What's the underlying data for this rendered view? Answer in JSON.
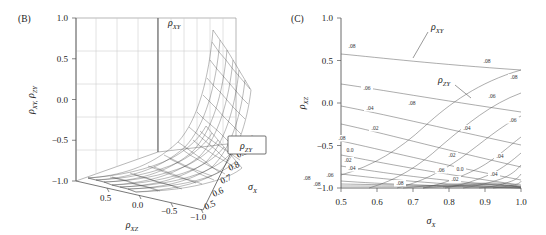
{
  "figure": {
    "panels": [
      "B",
      "C"
    ],
    "background": "#ffffff",
    "line_color": "#3a3a3a"
  },
  "panelB": {
    "tag": "(B)",
    "type": "surface3d",
    "y_axis": {
      "label_rho1": "ρ",
      "label_sub1": "XY,",
      "label_rho2": "ρ",
      "label_sub2": "ZY",
      "ticks": [
        "1.0",
        "0.5",
        "0.0",
        "−0.5",
        "−1.0"
      ],
      "values": [
        1.0,
        0.5,
        0.0,
        -0.5,
        -1.0
      ],
      "range": [
        -1.0,
        1.0
      ]
    },
    "x_axis": {
      "label_rho": "ρ",
      "label_sub": "XZ",
      "ticks": [
        "0.5",
        "0.0",
        "−0.5",
        "−1.0"
      ],
      "values": [
        0.5,
        0.0,
        -0.5,
        -1.0
      ],
      "range": [
        1.0,
        -1.0
      ]
    },
    "z_axis": {
      "label_sigma": "σ",
      "label_sub": "X",
      "ticks": [
        "0.5",
        "0.6",
        "0.7",
        "0.8",
        "0.9",
        "1.0"
      ],
      "values": [
        0.5,
        0.6,
        0.7,
        0.8,
        0.9,
        1.0
      ],
      "range": [
        0.5,
        1.0
      ]
    },
    "surface_labels": [
      {
        "name": "surface-label-rho-xy",
        "rho": "ρ",
        "sub": "XY",
        "boxed": false
      },
      {
        "name": "surface-label-rho-zy",
        "rho": "ρ",
        "sub": "ZY",
        "boxed": true
      }
    ]
  },
  "panelC": {
    "tag": "(C)",
    "type": "contour",
    "y_axis": {
      "label_rho": "ρ",
      "label_sub": "XZ",
      "ticks": [
        "1.0",
        "0.5",
        "0.0",
        "−0.5",
        "−1.0"
      ],
      "values": [
        1.0,
        0.5,
        0.0,
        -0.5,
        -1.0
      ],
      "range": [
        -1.0,
        1.0
      ]
    },
    "x_axis": {
      "label_sigma": "σ",
      "label_sub": "X",
      "ticks": [
        "0.5",
        "0.6",
        "0.7",
        "0.8",
        "0.9",
        "1.0"
      ],
      "values": [
        0.5,
        0.6,
        0.7,
        0.8,
        0.9,
        1.0
      ],
      "range": [
        0.5,
        1.0
      ]
    },
    "series_labels": [
      {
        "name": "contour-family-rho-xy",
        "rho": "ρ",
        "sub": "XY"
      },
      {
        "name": "contour-family-rho-zy",
        "rho": "ρ",
        "sub": "ZY"
      }
    ],
    "contour_levels": [
      ".08",
      ".06",
      ".04",
      ".02",
      "0.0",
      "−.02",
      "−.04",
      "−.06",
      "−.08"
    ],
    "contour_labels": [
      {
        "text": ".08",
        "x": 352,
        "y": 48
      },
      {
        "text": ".08",
        "x": 487,
        "y": 63
      },
      {
        "text": ".08",
        "x": 514,
        "y": 79
      },
      {
        "text": ".06",
        "x": 367,
        "y": 90
      },
      {
        "text": ".08",
        "x": 412,
        "y": 105
      },
      {
        "text": ".06",
        "x": 492,
        "y": 98
      },
      {
        "text": ".04",
        "x": 370,
        "y": 110
      },
      {
        "text": ".06",
        "x": 513,
        "y": 122
      },
      {
        "text": ".02",
        "x": 375,
        "y": 130
      },
      {
        "text": ".04",
        "x": 467,
        "y": 130
      },
      {
        "text": ".08",
        "x": 342,
        "y": 140
      },
      {
        "text": "0.0",
        "x": 350,
        "y": 152
      },
      {
        "text": ".02",
        "x": 348,
        "y": 162
      },
      {
        "text": ".02",
        "x": 452,
        "y": 157
      },
      {
        "text": ".04",
        "x": 352,
        "y": 170
      },
      {
        "text": ".04",
        "x": 500,
        "y": 158
      },
      {
        "text": ".06",
        "x": 330,
        "y": 177
      },
      {
        "text": ".08",
        "x": 307,
        "y": 180
      },
      {
        "text": ".06",
        "x": 441,
        "y": 172
      },
      {
        "text": "0.0",
        "x": 460,
        "y": 171
      },
      {
        "text": ".04",
        "x": 494,
        "y": 176
      },
      {
        "text": ".08",
        "x": 400,
        "y": 185
      },
      {
        "text": ".02",
        "x": 455,
        "y": 181
      },
      {
        "text": ".08",
        "x": 317,
        "y": 186
      }
    ]
  },
  "chart_data": [
    {
      "type": "surface",
      "panel": "B",
      "title": "",
      "xlabel": "ρ_XZ",
      "ylabel": "ρ_XY, ρ_ZY",
      "zlabel": "σ_X",
      "xlim": [
        1.0,
        -1.0
      ],
      "ylim": [
        -1.0,
        1.0
      ],
      "zlim": [
        0.5,
        1.0
      ],
      "grid": true,
      "legend": [
        "ρ_XY",
        "ρ_ZY"
      ],
      "series": [
        {
          "name": "ρ_XY",
          "description": "upper sheet rising toward rho_XZ = -1.0, values span -1.0 to 0.9"
        },
        {
          "name": "ρ_ZY",
          "description": "lower sheet, values span -1.0 to 0.2"
        }
      ],
      "notes": "Two intersecting mesh sheets over the (rho_XZ, sigma_X) domain."
    },
    {
      "type": "line",
      "panel": "C",
      "title": "",
      "xlabel": "σ_X",
      "ylabel": "ρ_XZ",
      "xlim": [
        0.5,
        1.0
      ],
      "ylim": [
        -1.0,
        1.0
      ],
      "grid": false,
      "legend": [
        "ρ_XY",
        "ρ_ZY"
      ],
      "categories": [
        0.5,
        0.6,
        0.7,
        0.8,
        0.9,
        1.0
      ],
      "series": [
        {
          "name": "ρ_XY .08",
          "values": [
            0.57,
            0.5,
            0.44,
            0.38,
            0.31,
            0.25
          ]
        },
        {
          "name": "ρ_XY .06",
          "values": [
            0.22,
            0.14,
            0.06,
            -0.02,
            -0.1,
            -0.18
          ]
        },
        {
          "name": "ρ_XY .04",
          "values": [
            -0.06,
            -0.15,
            -0.24,
            -0.33,
            -0.42,
            -0.5
          ]
        },
        {
          "name": "ρ_XY .02",
          "values": [
            -0.29,
            -0.39,
            -0.48,
            -0.57,
            -0.66,
            -0.74
          ]
        },
        {
          "name": "ρ_XY 0.0",
          "values": [
            -0.51,
            -0.6,
            -0.68,
            -0.76,
            -0.84,
            -0.9
          ]
        },
        {
          "name": "ρ_XY -.02",
          "values": [
            -0.67,
            -0.75,
            -0.82,
            -0.88,
            -0.93,
            -0.96
          ]
        },
        {
          "name": "ρ_XY -.04",
          "values": [
            -0.79,
            -0.85,
            -0.9,
            -0.94,
            -0.97,
            -0.99
          ]
        },
        {
          "name": "ρ_XY -.06",
          "values": [
            -0.88,
            -0.92,
            -0.95,
            -0.97,
            -0.99,
            -1.0
          ]
        },
        {
          "name": "ρ_XY -.08",
          "values": [
            -0.95,
            -0.97,
            -0.98,
            -0.99,
            -1.0,
            -1.0
          ]
        },
        {
          "name": "ρ_ZY branch",
          "values": [
            -0.6,
            -0.45,
            -0.22,
            0.05,
            0.22,
            0.26
          ]
        }
      ],
      "contour_levels": [
        0.08,
        0.06,
        0.04,
        0.02,
        0.0,
        -0.02,
        -0.04,
        -0.06,
        -0.08
      ],
      "notes": "Two overlapping families of contour curves, one for rho_XY (shallow descending) and one for rho_ZY (steep ascending)."
    }
  ]
}
